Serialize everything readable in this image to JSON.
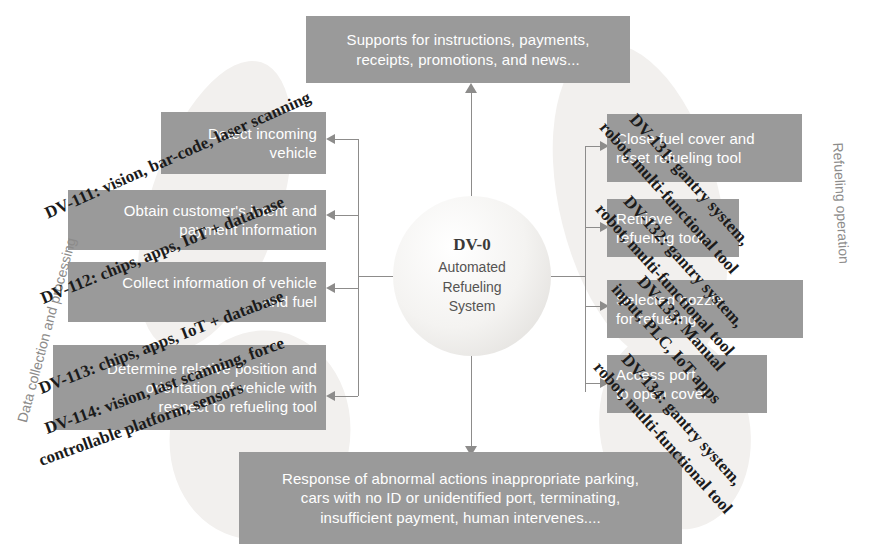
{
  "diagram": {
    "title": "DV-0 Automated Refueling System",
    "colors": {
      "box_fill": "#9a9a9a",
      "box_text": "#ffffff",
      "connector": "#8d8c8b",
      "label_text": "#1b1b1b",
      "caption_text": "#8c8b8a",
      "oval_fill": "#f4f3f1"
    }
  },
  "center": {
    "id": "DV-0",
    "line1": "Automated",
    "line2": "Refueling",
    "line3": "System"
  },
  "side_captions": {
    "left": "Data collection and processing",
    "right": "Refueling operation"
  },
  "top_box": {
    "line1": "Supports for instructions, payments,",
    "line2": "receipts, promotions, and news..."
  },
  "bottom_box": {
    "line1": "Response of abnormal actions inappropriate parking,",
    "line2": "cars with no ID or unidentified port, terminating,",
    "line3": "insufficient payment, human intervenes...."
  },
  "left_boxes": [
    {
      "key": "dv-111",
      "line1": "Detect incoming",
      "line2": "vehicle"
    },
    {
      "key": "dv-112",
      "line1": "Obtain customer's intent and",
      "line2": "payment information"
    },
    {
      "key": "dv-113",
      "line1": "Collect information of vehicle",
      "line2": "and fuel"
    },
    {
      "key": "dv-114",
      "line1": "Determine relative position and",
      "line2": "orientation of vehicle with",
      "line3": "respect to refueling tool"
    }
  ],
  "right_boxes": [
    {
      "key": "dv-131",
      "line1": "Close fuel cover and",
      "line2": "reset refueling tool"
    },
    {
      "key": "dv-132",
      "line1": "Retrieve",
      "line2": "refueling tool"
    },
    {
      "key": "dv-133",
      "line1": "Selected nozzle",
      "line2": "for refueling"
    },
    {
      "key": "dv-134",
      "line1": "Access port",
      "line2": "to open cover"
    }
  ],
  "dv_labels": {
    "dv111": "DV-111: vision, bar-code, laser scanning",
    "dv112": "DV-112: chips, apps, IoT + database",
    "dv113": "DV-113: chips, apps, IoT + database",
    "dv114_l1": "DV-114: vision, last scanning, force",
    "dv114_l2": "controllable platform, sensors",
    "dv131_l1": "DV-131: gantry system,",
    "dv131_l2": "robot, multi-functional tool",
    "dv132_l1": "DV-132: gantry system,",
    "dv132_l2": "robot, multi-functional tool",
    "dv133_l1": "DV-133: Manual",
    "dv133_l2": "input, PLC, IoT apps",
    "dv134_l1": "DV-134: gantry system,",
    "dv134_l2": "robot, multi-functional tool"
  }
}
